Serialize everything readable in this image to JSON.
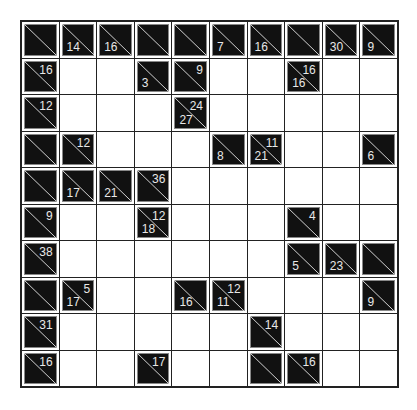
{
  "puzzle": {
    "type": "kakuro",
    "rows": 10,
    "cols": 10,
    "colors": {
      "clue_bg": "#111111",
      "cell_bg": "#ffffff",
      "grid_line": "#222222",
      "text": "#e8e8e8"
    },
    "grid": [
      [
        {
          "t": "B"
        },
        {
          "t": "B",
          "d": "14"
        },
        {
          "t": "B",
          "d": "16"
        },
        {
          "t": "B"
        },
        {
          "t": "B"
        },
        {
          "t": "B",
          "d": "7"
        },
        {
          "t": "B",
          "d": "16"
        },
        {
          "t": "B"
        },
        {
          "t": "B",
          "d": "30"
        },
        {
          "t": "B",
          "d": "9"
        }
      ],
      [
        {
          "t": "B",
          "r": "16"
        },
        {
          "t": "W"
        },
        {
          "t": "W"
        },
        {
          "t": "B",
          "d": "3"
        },
        {
          "t": "B",
          "r": "9"
        },
        {
          "t": "W"
        },
        {
          "t": "W"
        },
        {
          "t": "B",
          "d": "16",
          "r": "16"
        },
        {
          "t": "W"
        },
        {
          "t": "W"
        }
      ],
      [
        {
          "t": "B",
          "r": "12"
        },
        {
          "t": "W"
        },
        {
          "t": "W"
        },
        {
          "t": "W"
        },
        {
          "t": "B",
          "d": "27",
          "r": "24"
        },
        {
          "t": "W"
        },
        {
          "t": "W"
        },
        {
          "t": "W"
        },
        {
          "t": "W"
        },
        {
          "t": "W"
        }
      ],
      [
        {
          "t": "B"
        },
        {
          "t": "B",
          "r": "12"
        },
        {
          "t": "W"
        },
        {
          "t": "W"
        },
        {
          "t": "W"
        },
        {
          "t": "B",
          "d": "8"
        },
        {
          "t": "B",
          "d": "21",
          "r": "11"
        },
        {
          "t": "W"
        },
        {
          "t": "W"
        },
        {
          "t": "B",
          "d": "6"
        }
      ],
      [
        {
          "t": "B"
        },
        {
          "t": "B",
          "d": "17"
        },
        {
          "t": "B",
          "d": "21"
        },
        {
          "t": "B",
          "r": "36"
        },
        {
          "t": "W"
        },
        {
          "t": "W"
        },
        {
          "t": "W"
        },
        {
          "t": "W"
        },
        {
          "t": "W"
        },
        {
          "t": "W"
        }
      ],
      [
        {
          "t": "B",
          "r": "9"
        },
        {
          "t": "W"
        },
        {
          "t": "W"
        },
        {
          "t": "B",
          "d": "18",
          "r": "12"
        },
        {
          "t": "W"
        },
        {
          "t": "W"
        },
        {
          "t": "W"
        },
        {
          "t": "B",
          "r": "4"
        },
        {
          "t": "W"
        },
        {
          "t": "W"
        }
      ],
      [
        {
          "t": "B",
          "r": "38"
        },
        {
          "t": "W"
        },
        {
          "t": "W"
        },
        {
          "t": "W"
        },
        {
          "t": "W"
        },
        {
          "t": "W"
        },
        {
          "t": "W"
        },
        {
          "t": "B",
          "d": "5"
        },
        {
          "t": "B",
          "d": "23"
        },
        {
          "t": "B"
        }
      ],
      [
        {
          "t": "B"
        },
        {
          "t": "B",
          "d": "17",
          "r": "5"
        },
        {
          "t": "W"
        },
        {
          "t": "W"
        },
        {
          "t": "B",
          "d": "16"
        },
        {
          "t": "B",
          "d": "11",
          "r": "12"
        },
        {
          "t": "W"
        },
        {
          "t": "W"
        },
        {
          "t": "W"
        },
        {
          "t": "B",
          "d": "9"
        }
      ],
      [
        {
          "t": "B",
          "r": "31"
        },
        {
          "t": "W"
        },
        {
          "t": "W"
        },
        {
          "t": "W"
        },
        {
          "t": "W"
        },
        {
          "t": "W"
        },
        {
          "t": "B",
          "r": "14"
        },
        {
          "t": "W"
        },
        {
          "t": "W"
        },
        {
          "t": "W"
        }
      ],
      [
        {
          "t": "B",
          "r": "16"
        },
        {
          "t": "W"
        },
        {
          "t": "W"
        },
        {
          "t": "B",
          "r": "17"
        },
        {
          "t": "W"
        },
        {
          "t": "W"
        },
        {
          "t": "B"
        },
        {
          "t": "B",
          "r": "16"
        },
        {
          "t": "W"
        },
        {
          "t": "W"
        }
      ]
    ]
  }
}
